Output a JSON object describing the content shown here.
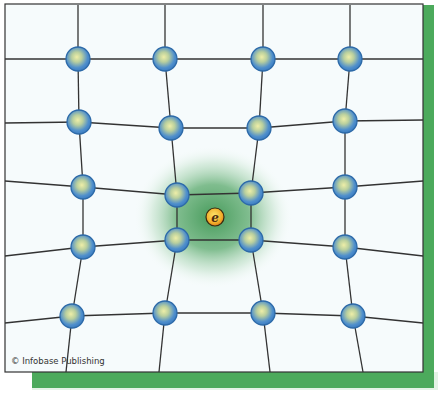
{
  "figure": {
    "credit": "© Infobase Publishing",
    "colors": {
      "background": "#f6fbfc",
      "frame_border": "#333333",
      "shadow_green": "#4caa5c",
      "shadow_light": "#e4f3e6",
      "lattice_line": "#333333",
      "ion_outer": "#3a7fc4",
      "ion_inner": "#e6e7a0",
      "polaron_glow": "#3f9a55",
      "electron_outer": "#e38a1e",
      "electron_inner": "#f7d448"
    },
    "electron": {
      "label": "e",
      "x": 215,
      "y": 217
    },
    "ions": [
      [
        [
          78,
          59
        ],
        [
          165,
          59
        ],
        [
          263,
          59
        ],
        [
          350,
          59
        ]
      ],
      [
        [
          79,
          122
        ],
        [
          171,
          128
        ],
        [
          259,
          128
        ],
        [
          345,
          121
        ]
      ],
      [
        [
          83,
          187
        ],
        [
          177,
          195
        ],
        [
          251,
          193
        ],
        [
          345,
          187
        ]
      ],
      [
        [
          83,
          247
        ],
        [
          177,
          240
        ],
        [
          251,
          240
        ],
        [
          345,
          247
        ]
      ],
      [
        [
          72,
          316
        ],
        [
          165,
          313
        ],
        [
          263,
          313
        ],
        [
          353,
          316
        ]
      ]
    ],
    "top_ends": [
      [
        78,
        5
      ],
      [
        165,
        5
      ],
      [
        263,
        5
      ],
      [
        350,
        5
      ]
    ],
    "bottom_ends": [
      [
        66,
        372
      ],
      [
        159,
        372
      ],
      [
        270,
        372
      ],
      [
        363,
        372
      ]
    ],
    "left_ends": [
      [
        5,
        59
      ],
      [
        5,
        123
      ],
      [
        5,
        181
      ],
      [
        5,
        256
      ],
      [
        5,
        323
      ]
    ],
    "right_ends": [
      [
        423,
        59
      ],
      [
        423,
        120
      ],
      [
        423,
        181
      ],
      [
        423,
        256
      ],
      [
        423,
        323
      ]
    ]
  }
}
